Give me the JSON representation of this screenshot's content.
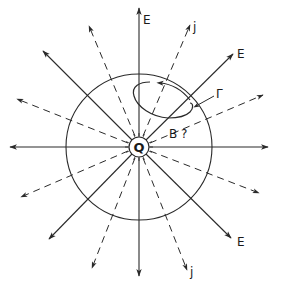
{
  "diagram": {
    "center": {
      "x": 139,
      "y": 147
    },
    "charge": {
      "label": "Q",
      "radius": 10
    },
    "sphere": {
      "radius": 73
    },
    "colors": {
      "ink": "#2a2a2a",
      "background": "#ffffff"
    },
    "labels": {
      "e_top": "E",
      "e_upper_right": "E",
      "e_lower_right": "E",
      "j_top": "j",
      "j_bottom": "j",
      "gamma": "Γ",
      "b_question": "B ?"
    },
    "field_lines_solid": [
      {
        "name": "E-up",
        "x": 139,
        "y": 8
      },
      {
        "name": "E-upper-right",
        "x": 233,
        "y": 54
      },
      {
        "name": "E-right",
        "x": 268,
        "y": 147
      },
      {
        "name": "E-lower-right",
        "x": 231,
        "y": 238
      },
      {
        "name": "E-down",
        "x": 139,
        "y": 276
      },
      {
        "name": "E-lower-left",
        "x": 49,
        "y": 239
      },
      {
        "name": "E-left",
        "x": 10,
        "y": 147
      },
      {
        "name": "E-upper-left",
        "x": 43,
        "y": 51
      }
    ],
    "current_lines_dashed": [
      {
        "name": "j-up-right",
        "x": 190,
        "y": 25
      },
      {
        "name": "j-right-up",
        "x": 263,
        "y": 95
      },
      {
        "name": "j-right-down",
        "x": 259,
        "y": 193
      },
      {
        "name": "j-down-right",
        "x": 187,
        "y": 270
      },
      {
        "name": "j-down-left",
        "x": 92,
        "y": 268
      },
      {
        "name": "j-left-down",
        "x": 21,
        "y": 197
      },
      {
        "name": "j-left-up",
        "x": 17,
        "y": 99
      },
      {
        "name": "j-up-left",
        "x": 89,
        "y": 26
      }
    ]
  }
}
